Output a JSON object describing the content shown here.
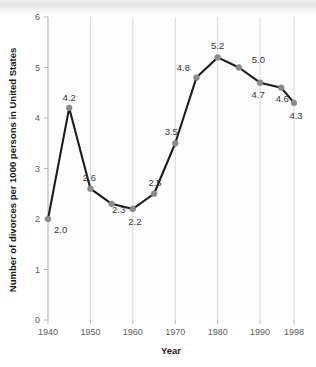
{
  "chart_data": {
    "type": "line",
    "title": "",
    "xlabel": "Year",
    "ylabel": "Number of divorces per 1000 persons in United States",
    "x": [
      1940,
      1945,
      1950,
      1955,
      1960,
      1965,
      1970,
      1975,
      1980,
      1985,
      1990,
      1995,
      1998
    ],
    "values": [
      2.0,
      4.2,
      2.6,
      2.3,
      2.2,
      2.5,
      3.5,
      4.8,
      5.2,
      5.0,
      4.7,
      4.6,
      4.3
    ],
    "point_labels": [
      "2.0",
      "4.2",
      "2.6",
      "2.3",
      "2.2",
      "2.5",
      "3.5",
      "4.8",
      "5.2",
      "5.0",
      "4.7",
      "4.6",
      "4.3"
    ],
    "xlim": [
      1940,
      1998
    ],
    "ylim": [
      0,
      6
    ],
    "ytick_labels": [
      "0",
      "1",
      "2",
      "3",
      "4",
      "5",
      "6"
    ],
    "ytick_values": [
      0,
      1,
      2,
      3,
      4,
      5,
      6
    ],
    "xtick_labels": [
      "1940",
      "1950",
      "1960",
      "1970",
      "1980",
      "1990",
      "1998"
    ],
    "xtick_values": [
      1940,
      1950,
      1960,
      1970,
      1980,
      1990,
      1998
    ],
    "grid": "vertical-only",
    "legend": "none",
    "series_color": "#1c1c1c",
    "marker_color": "#8a8a8a",
    "gridline_color": "#d8d8d8",
    "axis_color": "#b9b9b9"
  }
}
